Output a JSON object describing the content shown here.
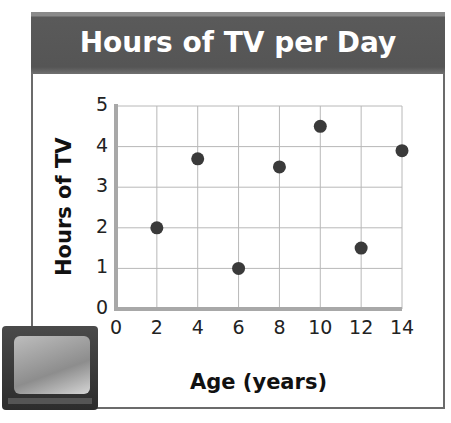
{
  "chart_data": {
    "type": "scatter",
    "title": "Hours of TV per Day",
    "xlabel": "Age (years)",
    "ylabel": "Hours of TV",
    "x": [
      2,
      4,
      6,
      8,
      10,
      12,
      14
    ],
    "y": [
      2,
      3.7,
      1,
      3.5,
      4.5,
      1.5,
      3.9
    ],
    "xlim": [
      0,
      14
    ],
    "ylim": [
      0,
      5
    ],
    "x_ticks": [
      "0",
      "2",
      "4",
      "6",
      "8",
      "10",
      "12",
      "14"
    ],
    "y_ticks": [
      "0",
      "1",
      "2",
      "3",
      "4",
      "5"
    ],
    "grid": true,
    "legend": null,
    "marker_color": "#3a3a3a",
    "title_bar_color": "#555555"
  },
  "labels": {
    "title": "Hours of TV per Day",
    "xlabel": "Age (years)",
    "ylabel": "Hours of TV"
  },
  "ticks": {
    "x": [
      "0",
      "2",
      "4",
      "6",
      "8",
      "10",
      "12",
      "14"
    ],
    "y": [
      "0",
      "1",
      "2",
      "3",
      "4",
      "5"
    ]
  },
  "illustration": {
    "name": "television"
  }
}
